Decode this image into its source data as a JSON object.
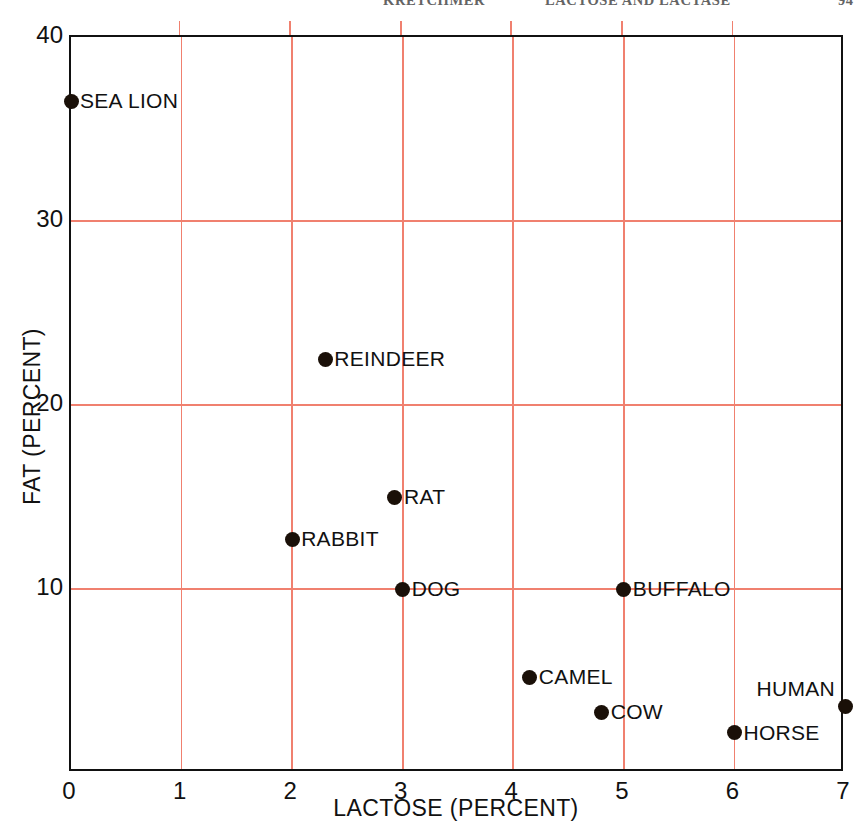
{
  "header": {
    "author": "KRETCHMER",
    "title": "LACTOSE AND LACTASE",
    "page": "94"
  },
  "chart_data": {
    "type": "scatter",
    "title": "",
    "xlabel": "LACTOSE (PERCENT)",
    "ylabel": "FAT (PERCENT)",
    "xlim": [
      0,
      7
    ],
    "ylim": [
      0,
      40
    ],
    "xticks": [
      0,
      1,
      2,
      3,
      4,
      5,
      6,
      7
    ],
    "yticks": [
      10,
      20,
      30,
      40
    ],
    "xtick_labels": [
      "0",
      "1",
      "2",
      "3",
      "4",
      "5",
      "6",
      "7"
    ],
    "ytick_labels": [
      "10",
      "20",
      "30",
      "40"
    ],
    "grid": true,
    "grid_color": "#f0806f",
    "marker_color": "#1a1008",
    "legend": "none",
    "points": [
      {
        "label": "SEA LION",
        "x": 0.0,
        "y": 36.5,
        "label_pos": "right"
      },
      {
        "label": "REINDEER",
        "x": 2.3,
        "y": 22.5,
        "label_pos": "right"
      },
      {
        "label": "RAT",
        "x": 2.93,
        "y": 15.0,
        "label_pos": "right"
      },
      {
        "label": "RABBIT",
        "x": 2.0,
        "y": 12.7,
        "label_pos": "right"
      },
      {
        "label": "DOG",
        "x": 3.0,
        "y": 10.0,
        "label_pos": "right"
      },
      {
        "label": "BUFFALO",
        "x": 5.0,
        "y": 10.0,
        "label_pos": "right"
      },
      {
        "label": "CAMEL",
        "x": 4.15,
        "y": 5.2,
        "label_pos": "right"
      },
      {
        "label": "COW",
        "x": 4.8,
        "y": 3.3,
        "label_pos": "right"
      },
      {
        "label": "HORSE",
        "x": 6.0,
        "y": 2.2,
        "label_pos": "right"
      },
      {
        "label": "HUMAN",
        "x": 7.0,
        "y": 3.6,
        "label_pos": "upleft"
      }
    ]
  }
}
